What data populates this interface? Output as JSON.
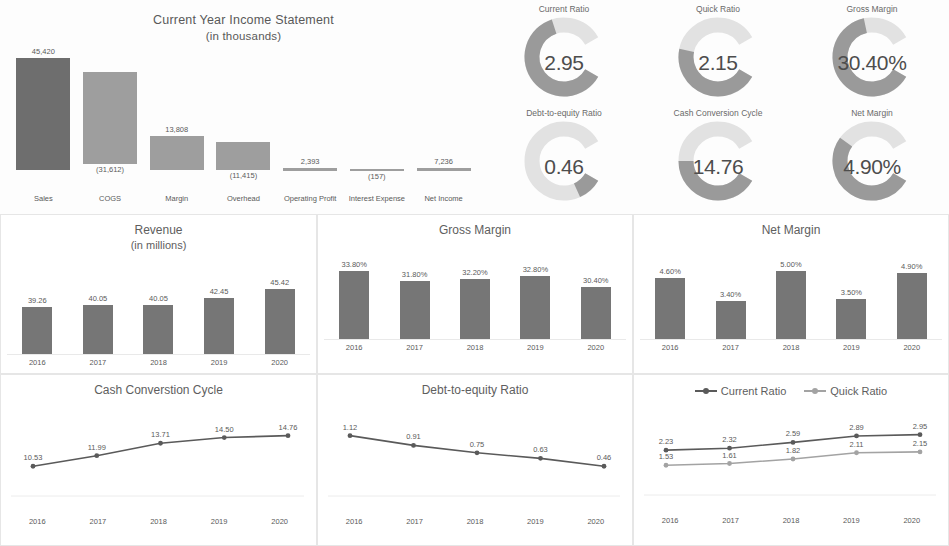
{
  "income_statement": {
    "title": "Current Year Income Statement",
    "subtitle": "(in thousands)",
    "categories": [
      "Sales",
      "COGS",
      "Margin",
      "Overhead",
      "Operating Profit",
      "Interest Expense",
      "Net Income"
    ],
    "labels": [
      "45,420",
      "(31,612)",
      "13,808",
      "(11,415)",
      "2,393",
      "(157)",
      "7,236"
    ],
    "values": [
      45420,
      -31612,
      13808,
      -11415,
      2393,
      -157,
      7236
    ]
  },
  "gauges": [
    {
      "label": "Current Ratio",
      "value": "2.95",
      "fill_pct": 74
    },
    {
      "label": "Quick Ratio",
      "value": "2.15",
      "fill_pct": 54
    },
    {
      "label": "Gross Margin",
      "value": "30.40%",
      "fill_pct": 76
    },
    {
      "label": "Debt-to-equity Ratio",
      "value": "0.46",
      "fill_pct": 12
    },
    {
      "label": "Cash Conversion Cycle",
      "value": "14.76",
      "fill_pct": 50
    },
    {
      "label": "Net Margin",
      "value": "4.90%",
      "fill_pct": 62
    }
  ],
  "chart_data": [
    {
      "type": "bar",
      "title": "Revenue",
      "subtitle": "(in millions)",
      "categories": [
        "2016",
        "2017",
        "2018",
        "2019",
        "2020"
      ],
      "values": [
        39.26,
        40.05,
        40.05,
        42.45,
        45.42
      ],
      "labels": [
        "39.26",
        "40.05",
        "40.05",
        "42.45",
        "45.42"
      ],
      "xlabel": "",
      "ylabel": "",
      "ylim": [
        0,
        50
      ],
      "grid": false
    },
    {
      "type": "bar",
      "title": "Gross Margin",
      "subtitle": "",
      "categories": [
        "2016",
        "2017",
        "2018",
        "2019",
        "2020"
      ],
      "values": [
        33.8,
        31.8,
        32.2,
        32.8,
        30.4
      ],
      "labels": [
        "33.80%",
        "31.80%",
        "32.20%",
        "32.80%",
        "30.40%"
      ],
      "xlabel": "",
      "ylabel": "",
      "ylim": [
        0,
        36
      ],
      "grid": false
    },
    {
      "type": "bar",
      "title": "Net Margin",
      "subtitle": "",
      "categories": [
        "2016",
        "2017",
        "2018",
        "2019",
        "2020"
      ],
      "values": [
        4.6,
        3.4,
        5.0,
        3.5,
        4.9
      ],
      "labels": [
        "4.60%",
        "3.40%",
        "5.00%",
        "3.50%",
        "4.90%"
      ],
      "xlabel": "",
      "ylabel": "",
      "ylim": [
        0,
        5.5
      ],
      "grid": false
    },
    {
      "type": "line",
      "title": "Cash Converstion Cycle",
      "subtitle": "",
      "categories": [
        "2016",
        "2017",
        "2018",
        "2019",
        "2020"
      ],
      "values": [
        10.53,
        11.99,
        13.71,
        14.5,
        14.76
      ],
      "labels": [
        "10.53",
        "11.99",
        "13.71",
        "14.50",
        "14.76"
      ],
      "xlabel": "",
      "ylabel": "",
      "ylim": [
        0,
        16
      ],
      "grid": false
    },
    {
      "type": "line",
      "title": "Debt-to-equity Ratio",
      "subtitle": "",
      "categories": [
        "2016",
        "2017",
        "2018",
        "2019",
        "2020"
      ],
      "values": [
        1.12,
        0.91,
        0.75,
        0.63,
        0.46
      ],
      "labels": [
        "1.12",
        "0.91",
        "0.75",
        "0.63",
        "0.46"
      ],
      "xlabel": "",
      "ylabel": "",
      "ylim": [
        0,
        1.25
      ],
      "grid": false
    },
    {
      "type": "line",
      "title": "",
      "subtitle": "",
      "categories": [
        "2016",
        "2017",
        "2018",
        "2019",
        "2020"
      ],
      "legend": [
        "Current Ratio",
        "Quick Ratio"
      ],
      "legend_position": "top",
      "series": [
        {
          "name": "Current Ratio",
          "values": [
            2.23,
            2.32,
            2.59,
            2.89,
            2.95
          ],
          "labels": [
            "2.23",
            "2.32",
            "2.59",
            "2.89",
            "2.95"
          ]
        },
        {
          "name": "Quick Ratio",
          "values": [
            1.53,
            1.61,
            1.82,
            2.11,
            2.15
          ],
          "labels": [
            "1.53",
            "1.61",
            "1.82",
            "2.11",
            "2.15"
          ]
        }
      ],
      "xlabel": "",
      "ylabel": "",
      "ylim": [
        0,
        3.2
      ],
      "grid": false
    }
  ],
  "colors": {
    "bar_dark": "#6e6e6e",
    "bar_mid": "#767676",
    "bar_light": "#9e9e9e",
    "gauge_fill": "#9a9a9a",
    "gauge_track": "#e2e2e2",
    "line_dark": "#5a5a5a",
    "line_light": "#a3a3a3",
    "panel_border": "#e6e6e6",
    "text": "#5a5a5a"
  }
}
